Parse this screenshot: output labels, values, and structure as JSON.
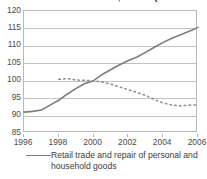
{
  "chart_data": {
    "type": "line",
    "title": "Index of volume of sales, EU-25 (2000 = 100)",
    "xlabel": "",
    "ylabel": "",
    "xlim": [
      1996,
      2006
    ],
    "ylim": [
      85,
      120
    ],
    "grid": true,
    "legend_position": "bottom-left",
    "x_ticks": [
      "1996",
      "1998",
      "2000",
      "2002",
      "2004",
      "2006"
    ],
    "x_tick_values": [
      1996,
      1998,
      2000,
      2002,
      2004,
      2006
    ],
    "y_ticks": [
      "85",
      "90",
      "95",
      "100",
      "105",
      "110",
      "115",
      "120"
    ],
    "y_tick_values": [
      85,
      90,
      95,
      100,
      105,
      110,
      115,
      120
    ],
    "x": [
      1996,
      1996.5,
      1997,
      1997.5,
      1998,
      1998.5,
      1999,
      1999.5,
      2000,
      2000.5,
      2001,
      2001.5,
      2002,
      2002.5,
      2003,
      2003.5,
      2004,
      2004.5,
      2005,
      2005.5,
      2006
    ],
    "series": [
      {
        "name": "Retail trade and repair of personal and household goods",
        "style": "solid",
        "color": "#7c7c7c",
        "in_legend": true,
        "values": [
          91.0,
          91.2,
          91.6,
          93.0,
          94.4,
          96.2,
          97.8,
          99.2,
          100.0,
          101.8,
          103.2,
          104.6,
          105.8,
          106.8,
          108.2,
          109.6,
          111.0,
          112.2,
          113.2,
          114.2,
          115.3
        ]
      },
      {
        "name": "Second series (dotted)",
        "style": "dotted",
        "color": "#8c8c8c",
        "in_legend": false,
        "values": [
          null,
          null,
          null,
          null,
          100.4,
          100.6,
          100.2,
          100.1,
          100.0,
          99.6,
          99.0,
          98.2,
          97.4,
          96.6,
          95.8,
          94.6,
          93.6,
          93.0,
          92.8,
          93.0,
          93.0
        ]
      }
    ]
  },
  "legend": {
    "entries": [
      {
        "label": "Retail trade and repair of personal and household goods",
        "marker": "solid-line-swatch"
      }
    ]
  }
}
